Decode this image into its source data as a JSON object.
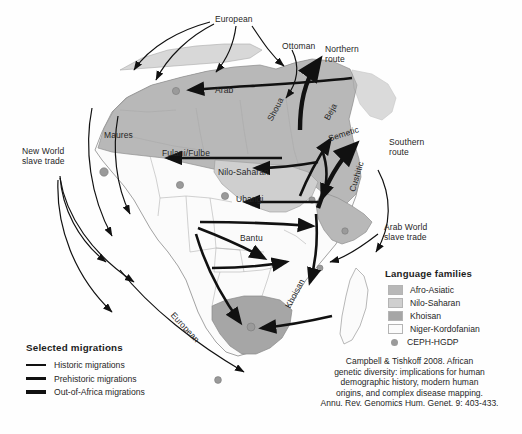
{
  "figure": {
    "type": "map-diagram"
  },
  "map_labels": [
    {
      "id": "european-top",
      "text": "European",
      "x": 215,
      "y": 14,
      "rot": 0,
      "style": "plain"
    },
    {
      "id": "ottoman",
      "text": "Ottoman",
      "x": 282,
      "y": 41,
      "rot": 0,
      "style": "plain"
    },
    {
      "id": "northern-route",
      "text": "Northern\nroute",
      "x": 325,
      "y": 44,
      "rot": 0,
      "style": "plain"
    },
    {
      "id": "arab",
      "text": "Arab",
      "x": 215,
      "y": 85,
      "rot": 0,
      "style": "plain"
    },
    {
      "id": "maures",
      "text": "Maures",
      "x": 104,
      "y": 130,
      "rot": 0,
      "style": "plain"
    },
    {
      "id": "new-world",
      "text": "New World\nslave trade",
      "x": 22,
      "y": 146,
      "rot": 0,
      "style": "plain"
    },
    {
      "id": "fulani-fulbe",
      "text": "Fulani/Fulbe",
      "x": 162,
      "y": 148,
      "rot": 0,
      "style": "plain"
    },
    {
      "id": "nilo-saharan-map",
      "text": "Nilo-Saharan",
      "x": 218,
      "y": 167,
      "rot": 0,
      "style": "plain"
    },
    {
      "id": "shoua",
      "text": "Shoua",
      "x": 265,
      "y": 118,
      "rot": -62,
      "style": "plain"
    },
    {
      "id": "beja",
      "text": "Beja",
      "x": 322,
      "y": 117,
      "rot": -62,
      "style": "plain"
    },
    {
      "id": "semetic",
      "text": "Semetic",
      "x": 327,
      "y": 134,
      "rot": -18,
      "style": "plain"
    },
    {
      "id": "southern-route",
      "text": "Southern\nroute",
      "x": 389,
      "y": 137,
      "rot": 0,
      "style": "plain"
    },
    {
      "id": "ubangi",
      "text": "Ubangi",
      "x": 236,
      "y": 194,
      "rot": 0,
      "style": "plain"
    },
    {
      "id": "cushitic",
      "text": "Cushitic",
      "x": 347,
      "y": 190,
      "rot": -73,
      "style": "plain"
    },
    {
      "id": "bantu",
      "text": "Bantu",
      "x": 240,
      "y": 233,
      "rot": 0,
      "style": "plain"
    },
    {
      "id": "arab-world",
      "text": "Arab World\nslave trade",
      "x": 384,
      "y": 222,
      "rot": 0,
      "style": "plain"
    },
    {
      "id": "khoisan-map",
      "text": "Khoisan",
      "x": 283,
      "y": 305,
      "rot": -62,
      "style": "plain"
    },
    {
      "id": "european-route",
      "text": "European",
      "x": 176,
      "y": 310,
      "rot": 47,
      "style": "plain"
    }
  ],
  "language_legend": {
    "title": "Language families",
    "items": [
      {
        "label": "Afro-Asiatic",
        "color": "#b8b8b8",
        "marker": "swatch"
      },
      {
        "label": "Nilo-Saharan",
        "color": "#cfcfcf",
        "marker": "swatch"
      },
      {
        "label": "Khoisan",
        "color": "#a6a6a6",
        "marker": "swatch"
      },
      {
        "label": "Niger-Kordofanian",
        "color": "#fbfbfb",
        "marker": "swatch"
      },
      {
        "label": "CEPH-HGDP",
        "color": "#9a9a9a",
        "marker": "dot"
      }
    ]
  },
  "migration_legend": {
    "title": "Selected migrations",
    "items": [
      {
        "label": "Historic migrations",
        "weight": "l1"
      },
      {
        "label": "Prehistoric migrations",
        "weight": "l2"
      },
      {
        "label": "Out-of-Africa migrations",
        "weight": "l3"
      }
    ]
  },
  "citation": {
    "line1": "Campbell & Tishkoff 2008. African",
    "line2": "genetic diversity: implications for human",
    "line3": "demographic history, modern human",
    "line4": "origins, and complex disease mapping.",
    "line5": "Annu. Rev. Genomics Hum. Genet. 9: 403-433."
  },
  "colors": {
    "afro_asiatic": "#b8b8b8",
    "nilo_saharan": "#cfcfcf",
    "khoisan": "#a6a6a6",
    "niger_kordofanian": "#fbfbfb",
    "hgdp_dot": "#9a9a9a",
    "arrow": "#111111",
    "border": "#8a8a8a",
    "background": "#ffffff"
  }
}
